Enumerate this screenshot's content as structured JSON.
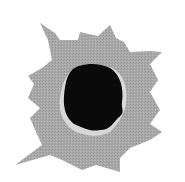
{
  "image": {
    "subject": "bullet-hole",
    "colors": {
      "background": "#ffffff",
      "torn_edge": "#a8a8a8",
      "torn_edge_dark": "#8c8c8c",
      "rim_highlight": "#e6e6e6",
      "hole": "#0a0a0a"
    }
  }
}
